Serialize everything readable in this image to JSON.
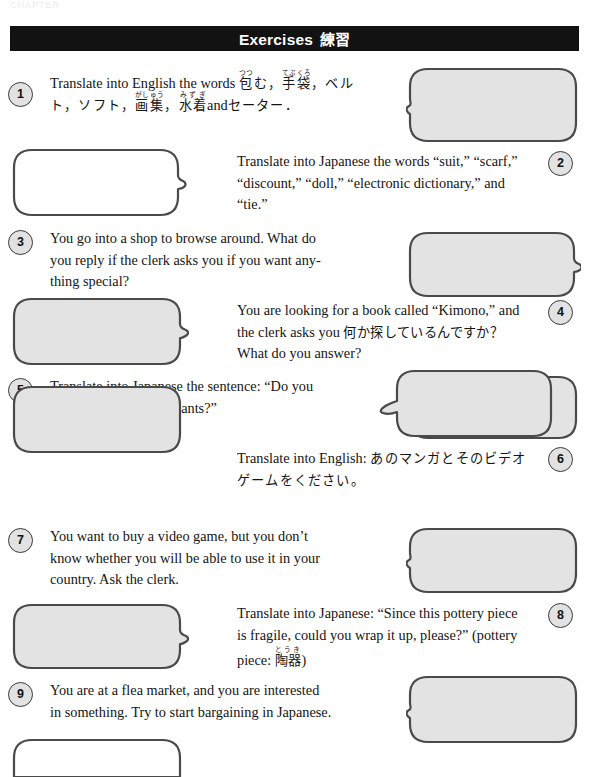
{
  "page": {
    "running_head": "CHAPTER",
    "banner": {
      "english": "Exercises",
      "japanese": "練習"
    }
  },
  "exercises": [
    {
      "number": "1",
      "side": "left",
      "bubble_side": "right",
      "bubble_fill": "#e3e3e3",
      "bubble_tail": "left",
      "text_plain": "Translate into English the words 包む，手袋，ベルト，ソフト，画集，水着 and セーター．",
      "english_lead": "Translate into English the words",
      "japanese_terms": [
        {
          "kanji": "包",
          "ruby": "つつ",
          "trailing": "む"
        },
        {
          "kanji": "手袋",
          "ruby": "てぶくろ",
          "trailing": ""
        },
        {
          "kanji": "画集",
          "ruby": "がしゅう",
          "trailing": ""
        },
        {
          "kanji": "水着",
          "ruby": "みずぎ",
          "trailing": ""
        }
      ],
      "katakana_terms": [
        "ベルト",
        "ソフト",
        "セーター"
      ],
      "conjunction": "and"
    },
    {
      "number": "2",
      "side": "right",
      "bubble_side": "left",
      "bubble_fill": "#ffffff",
      "bubble_tail": "right",
      "text_plain": "Translate into Japanese the words “suit,” “scarf,” “discount,” “doll,” “electronic dictionary,” and “tie.”",
      "lines": [
        "Translate into Japanese the words “suit,” “scarf,”",
        "“discount,” “doll,” “electronic dictionary,” and",
        "“tie.”"
      ]
    },
    {
      "number": "3",
      "side": "left",
      "bubble_side": "right",
      "bubble_fill": "#e3e3e3",
      "bubble_tail": "left",
      "text_plain": "You go into a shop to browse around. What do you reply if the clerk asks you if you want anything special?",
      "lines": [
        "You go into a shop to browse around. What do",
        "you reply if the clerk asks you if you want any-",
        "thing special?"
      ]
    },
    {
      "number": "4",
      "side": "right",
      "bubble_side": "left",
      "bubble_fill": "#e3e3e3",
      "bubble_tail": "right",
      "text_plain": "You are looking for a book called “Kimono,” and the clerk asks you 何か探しているんですか？ What do you answer?",
      "line1": "You are looking for a book called “Kimono,” and",
      "line2_en": "the clerk asks you",
      "line2_jp": "何か探しているんですか？",
      "line3": "What do you answer?"
    },
    {
      "number": "5",
      "side": "left",
      "bubble_side": "right",
      "bubble_fill": "#e3e3e3",
      "bubble_tail": "left",
      "text_plain": "Translate into Japanese the sentence: “Do you have a size ‘small’ in pants?”",
      "lines": [
        "Translate into Japanese the sentence: “Do you",
        "have a size ‘small’ in pants?”"
      ]
    },
    {
      "number": "6",
      "side": "right",
      "bubble_side": "left",
      "bubble_fill": "#e3e3e3",
      "bubble_tail": "right",
      "text_plain": "Translate into English: あのマンガとそのビデオゲームをください。",
      "line1_en": "Translate into English:",
      "line1_jp": "あのマンガとそのビデオ",
      "line2_jp": "ゲームをください。"
    },
    {
      "number": "7",
      "side": "left",
      "bubble_side": "right",
      "bubble_fill": "#e3e3e3",
      "bubble_tail": "left",
      "text_plain": "You want to buy a video game, but you don’t know whether you will be able to use it in your country. Ask the clerk.",
      "lines": [
        "You want to buy a video game, but you don’t",
        "know whether you will be able to use it in your",
        "country. Ask the clerk."
      ]
    },
    {
      "number": "8",
      "side": "right",
      "bubble_side": "left",
      "bubble_fill": "#e3e3e3",
      "bubble_tail": "right",
      "text_plain": "Translate into Japanese: “Since this pottery piece is fragile, could you wrap it up, please?” (pottery piece: 陶器)",
      "line1": "Translate into Japanese: “Since this pottery piece",
      "line2": "is fragile, could you wrap it up, please?” (pottery",
      "line3_en": "piece:",
      "line3_kanji": "陶器",
      "line3_ruby": "とうき",
      "line3_close": ")"
    },
    {
      "number": "9",
      "side": "left",
      "bubble_side": "right",
      "bubble_fill": "#e3e3e3",
      "bubble_tail": "left",
      "text_plain": "You are at a flea market, and you are interested in something. Try to start bargaining in Japanese.",
      "lines": [
        "You are at a flea market, and you are interested",
        "in something. Try to start bargaining in Japanese."
      ]
    }
  ],
  "bottom_bubble": {
    "fill": "#ffffff",
    "tail": "right",
    "clipped": true
  },
  "colors": {
    "banner_bg": "#121212",
    "banner_text": "#ffffff",
    "bubble_stroke": "#4a4a4a",
    "bubble_gray": "#e3e3e3",
    "bubble_white": "#ffffff",
    "badge_fill": "#e2e2e2",
    "text": "#141414"
  }
}
